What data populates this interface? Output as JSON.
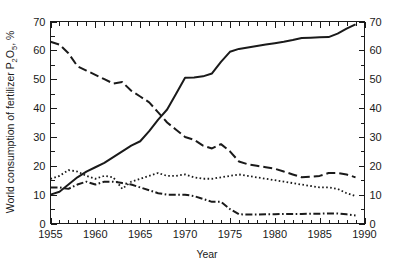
{
  "figure": {
    "background_color": "#ffffff",
    "line_color": "#1a1a1a"
  },
  "chart_data": {
    "type": "line",
    "title": "",
    "xlabel": "Year",
    "ylabel": "World consumption of fertilizer P2O5, %",
    "ylabel_parts": {
      "prefix": "World consumption of fertilizer P",
      "sub1": "2",
      "mid": "O",
      "sub2": "5",
      "suffix": ", %"
    },
    "xlim": [
      1955,
      1990
    ],
    "ylim": [
      0,
      70
    ],
    "grid": false,
    "legend": "none",
    "x_major_ticks": [
      1955,
      1960,
      1965,
      1970,
      1975,
      1980,
      1985,
      1990
    ],
    "x_tick_labels": [
      "1955",
      "1960",
      "1965",
      "1970",
      "1975",
      "1980",
      "1985",
      "1990"
    ],
    "x_minor_tick_step": 1,
    "y_major_ticks": [
      0,
      10,
      20,
      30,
      40,
      50,
      60,
      70
    ],
    "y_tick_labels": [
      "0",
      "10",
      "20",
      "30",
      "40",
      "50",
      "60",
      "70"
    ],
    "y_minor_tick_step": 5,
    "right_axis_ticks": [
      0,
      10,
      20,
      30,
      40,
      50,
      60,
      70
    ],
    "right_axis_tick_labels": [
      "0",
      "10",
      "20",
      "30",
      "40",
      "50",
      "60",
      "70"
    ],
    "x": [
      1955,
      1956,
      1957,
      1958,
      1959,
      1960,
      1961,
      1962,
      1963,
      1964,
      1965,
      1966,
      1967,
      1968,
      1969,
      1970,
      1971,
      1972,
      1973,
      1974,
      1975,
      1976,
      1977,
      1978,
      1979,
      1980,
      1981,
      1982,
      1983,
      1984,
      1985,
      1986,
      1987,
      1988,
      1989
    ],
    "series": [
      {
        "name": "series-solid",
        "style": "solid",
        "dasharray": "none",
        "width": 2.0,
        "values": [
          10.0,
          11.0,
          13.5,
          16.0,
          18.0,
          19.5,
          21.0,
          23.0,
          25.0,
          27.0,
          28.5,
          32.0,
          36.0,
          39.5,
          45.0,
          50.5,
          50.6,
          51.0,
          52.0,
          56.0,
          59.5,
          60.5,
          61.0,
          61.5,
          62.0,
          62.5,
          63.0,
          63.6,
          64.3,
          64.4,
          64.5,
          64.6,
          65.8,
          67.5,
          69.0
        ]
      },
      {
        "name": "series-long-dash",
        "style": "long-dash",
        "dasharray": "9,4",
        "width": 2.0,
        "values": [
          63.0,
          62.0,
          59.0,
          54.5,
          53.0,
          51.5,
          50.0,
          48.5,
          49.0,
          46.0,
          44.0,
          42.0,
          38.5,
          35.0,
          32.5,
          30.0,
          29.0,
          27.0,
          26.0,
          27.5,
          25.0,
          21.5,
          20.5,
          20.0,
          19.5,
          19.0,
          18.0,
          17.0,
          16.0,
          16.2,
          16.5,
          17.5,
          17.5,
          17.0,
          16.0
        ]
      },
      {
        "name": "series-dotted",
        "style": "dotted",
        "dasharray": "1.6,2.4",
        "width": 1.8,
        "values": [
          15.5,
          16.5,
          18.5,
          18.0,
          16.5,
          15.5,
          16.5,
          16.0,
          12.0,
          14.5,
          15.5,
          16.5,
          17.5,
          16.5,
          16.5,
          17.0,
          16.0,
          15.5,
          15.5,
          16.0,
          16.5,
          17.0,
          16.5,
          16.0,
          15.5,
          15.0,
          14.5,
          14.0,
          13.5,
          13.0,
          12.5,
          12.5,
          12.0,
          10.5,
          9.5
        ]
      },
      {
        "name": "series-dash-dot",
        "style": "dash-dot",
        "dasharray": "7,2.5,1.6,2.5",
        "width": 2.0,
        "values": [
          12.5,
          12.5,
          12.0,
          13.5,
          14.5,
          13.5,
          14.5,
          14.5,
          14.0,
          13.5,
          12.5,
          11.5,
          10.5,
          10.0,
          10.0,
          10.0,
          9.5,
          8.5,
          7.5,
          7.5,
          5.0,
          3.2,
          3.1,
          3.1,
          3.2,
          3.2,
          3.3,
          3.3,
          3.3,
          3.4,
          3.4,
          3.5,
          3.5,
          3.2,
          2.8
        ]
      }
    ]
  }
}
